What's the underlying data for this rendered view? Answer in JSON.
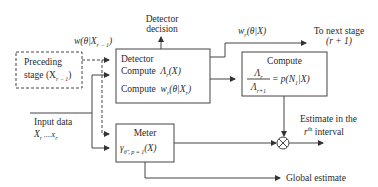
{
  "diagram": {
    "preceding_stage": {
      "line1": "Preceding",
      "line2": "stage (X",
      "sub": "r − 1",
      "close": ")"
    },
    "feedback_weight": {
      "text": "w(θ|X",
      "sub": "r − 1",
      "close": ")"
    },
    "detector_decision": {
      "line1": "Detector",
      "line2": "decision"
    },
    "detector_box": {
      "title": "Detector",
      "row1_label": "Compute",
      "row1_expr": "Λ",
      "row1_sub": "r",
      "row1_tail": "(X)",
      "row2_label": "Compute",
      "row2_expr": "w",
      "row2_sub": "r",
      "row2_tail": "(θ|X",
      "row2_sub2": "r",
      "row2_close": ")"
    },
    "output_weight": {
      "text": "w",
      "sub": "r",
      "tail": "(θ|X)"
    },
    "next_stage": {
      "line1": "To next stage",
      "line2": "(r + 1)"
    },
    "compute_box": {
      "title": "Compute",
      "numerator": "Λ",
      "numerator_sub": "r",
      "denominator": "Λ",
      "denominator_sub": "r+1",
      "rhs": "= p(N",
      "rhs_sub": "1",
      "rhs_tail": "|X)"
    },
    "input_data": {
      "line1": "Input data",
      "line2": "X",
      "sub_a": "r",
      "mid": " ....X",
      "sub_b": "r"
    },
    "meter_box": {
      "title": "Meter",
      "expr": "γ",
      "expr_sub": "θ̂ , p = 1",
      "expr_tail": "(X)"
    },
    "multiplier": {
      "symbol": "⊗"
    },
    "estimate_label": {
      "line1": "Estimate in the",
      "line2_sup_base": "r",
      "line2_sup": "th",
      "line2_tail": " interval"
    },
    "global_estimate": {
      "label": "Global estimate"
    },
    "colors": {
      "stroke": "#444444",
      "text": "#2a2a2a",
      "background": "#ffffff"
    }
  }
}
